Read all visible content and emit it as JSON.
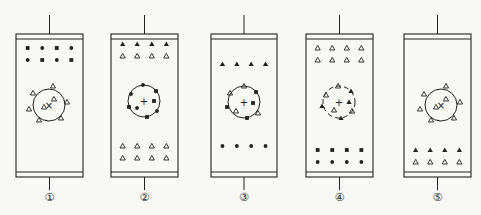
{
  "diagram": {
    "stroke_color": "#222222",
    "background": "#f8f8f6",
    "columns": [
      {
        "id": 1,
        "label": "①",
        "x": 16,
        "width": 67,
        "circle": {
          "cx": 49,
          "cy": 105,
          "r": 16,
          "style": "solid",
          "center_mark": "×"
        },
        "groups": [
          {
            "name": "top-row-1",
            "y": 48,
            "items": [
              "square",
              "dot",
              "square",
              "dot"
            ]
          },
          {
            "name": "top-row-2",
            "y": 60,
            "items": [
              "dot",
              "square",
              "dot",
              "square"
            ]
          }
        ],
        "circle_items": [
          {
            "shape": "triangle-open",
            "dx": -16,
            "dy": -12
          },
          {
            "shape": "triangle-open",
            "dx": 4,
            "dy": -19
          },
          {
            "shape": "triangle-open",
            "dx": 18,
            "dy": -3
          },
          {
            "shape": "triangle-open",
            "dx": 12,
            "dy": 13
          },
          {
            "shape": "triangle-open",
            "dx": -10,
            "dy": 15
          },
          {
            "shape": "triangle-open",
            "dx": -20,
            "dy": 4
          },
          {
            "shape": "triangle-open",
            "dx": 5,
            "dy": -6
          },
          {
            "shape": "triangle-open",
            "dx": -5,
            "dy": 2
          }
        ]
      },
      {
        "id": 2,
        "label": "②",
        "x": 111,
        "width": 67,
        "circle": {
          "cx": 144,
          "cy": 101,
          "r": 16,
          "style": "solid",
          "center_mark": "+"
        },
        "groups": [
          {
            "name": "top-row-1",
            "y": 44,
            "items": [
              "triangle-filled",
              "triangle-filled",
              "triangle-filled",
              "triangle-filled"
            ]
          },
          {
            "name": "top-row-2",
            "y": 56,
            "items": [
              "triangle-open",
              "triangle-open",
              "triangle-open",
              "triangle-open"
            ]
          },
          {
            "name": "bottom-row-1",
            "y": 146,
            "items": [
              "triangle-open",
              "triangle-open",
              "triangle-open",
              "triangle-open"
            ]
          },
          {
            "name": "bottom-row-2",
            "y": 158,
            "items": [
              "triangle-open",
              "triangle-open",
              "triangle-open",
              "triangle-open"
            ]
          }
        ],
        "circle_items": [
          {
            "shape": "dot",
            "dx": -1,
            "dy": -16
          },
          {
            "shape": "square",
            "dx": 12,
            "dy": -10
          },
          {
            "shape": "square",
            "dx": 10,
            "dy": 0
          },
          {
            "shape": "dot",
            "dx": 13,
            "dy": 10
          },
          {
            "shape": "square",
            "dx": 3,
            "dy": 16
          },
          {
            "shape": "dot",
            "dx": -7,
            "dy": 7
          },
          {
            "shape": "square",
            "dx": -15,
            "dy": 6
          },
          {
            "shape": "dot",
            "dx": -13,
            "dy": -7
          }
        ]
      },
      {
        "id": 3,
        "label": "③",
        "x": 211,
        "width": 66,
        "circle": {
          "cx": 244,
          "cy": 102,
          "r": 16,
          "style": "solid",
          "center_mark": "+"
        },
        "groups": [
          {
            "name": "top-row",
            "y": 64,
            "items": [
              "triangle-filled",
              "triangle-filled",
              "triangle-filled",
              "triangle-filled"
            ]
          },
          {
            "name": "bottom-row",
            "y": 146,
            "items": [
              "dot",
              "dot",
              "dot",
              "dot"
            ]
          }
        ],
        "circle_items": [
          {
            "shape": "triangle-open",
            "dx": 0,
            "dy": -16
          },
          {
            "shape": "square",
            "dx": 12,
            "dy": -10
          },
          {
            "shape": "square",
            "dx": 9,
            "dy": 1
          },
          {
            "shape": "triangle-open",
            "dx": 14,
            "dy": 11
          },
          {
            "shape": "square",
            "dx": 3,
            "dy": 16
          },
          {
            "shape": "triangle-open",
            "dx": -8,
            "dy": 9
          },
          {
            "shape": "square",
            "dx": -17,
            "dy": 5
          },
          {
            "shape": "triangle-open",
            "dx": -14,
            "dy": -9
          }
        ]
      },
      {
        "id": 4,
        "label": "④",
        "x": 306,
        "width": 67,
        "circle": {
          "cx": 339,
          "cy": 102,
          "r": 16,
          "style": "dashed",
          "center_mark": "+"
        },
        "groups": [
          {
            "name": "top-row-1",
            "y": 48,
            "items": [
              "triangle-open",
              "triangle-open",
              "triangle-open",
              "triangle-open"
            ]
          },
          {
            "name": "top-row-2",
            "y": 60,
            "items": [
              "triangle-open",
              "triangle-open",
              "triangle-open",
              "triangle-open"
            ]
          },
          {
            "name": "bottom-row-1",
            "y": 150,
            "items": [
              "square",
              "square",
              "square",
              "square"
            ]
          },
          {
            "name": "bottom-row-2",
            "y": 162,
            "items": [
              "dot",
              "dot",
              "dot",
              "dot"
            ]
          }
        ],
        "circle_items": [
          {
            "shape": "triangle-open",
            "dx": -1,
            "dy": -16
          },
          {
            "shape": "triangle-filled",
            "dx": 12,
            "dy": -11
          },
          {
            "shape": "triangle-filled",
            "dx": 10,
            "dy": 0
          },
          {
            "shape": "triangle-open",
            "dx": 13,
            "dy": 9
          },
          {
            "shape": "triangle-filled",
            "dx": 2,
            "dy": 16
          },
          {
            "shape": "triangle-open",
            "dx": -5,
            "dy": 8
          },
          {
            "shape": "triangle-filled",
            "dx": -17,
            "dy": 4
          },
          {
            "shape": "triangle-open",
            "dx": -13,
            "dy": -7
          }
        ]
      },
      {
        "id": 5,
        "label": "⑤",
        "x": 404,
        "width": 67,
        "circle": {
          "cx": 441,
          "cy": 105,
          "r": 16,
          "style": "solid",
          "center_mark": "×"
        },
        "groups": [
          {
            "name": "bottom-row-1",
            "y": 150,
            "items": [
              "triangle-filled",
              "triangle-filled",
              "triangle-filled",
              "triangle-filled"
            ]
          },
          {
            "name": "bottom-row-2",
            "y": 162,
            "items": [
              "triangle-open",
              "triangle-open",
              "triangle-open",
              "triangle-open"
            ]
          }
        ],
        "circle_items": [
          {
            "shape": "triangle-open",
            "dx": -17,
            "dy": -11
          },
          {
            "shape": "triangle-open",
            "dx": 5,
            "dy": -19
          },
          {
            "shape": "triangle-open",
            "dx": 19,
            "dy": -3
          },
          {
            "shape": "triangle-open",
            "dx": 13,
            "dy": 13
          },
          {
            "shape": "triangle-open",
            "dx": -10,
            "dy": 15
          },
          {
            "shape": "triangle-open",
            "dx": -21,
            "dy": 4
          },
          {
            "shape": "triangle-open",
            "dx": 5,
            "dy": -6
          },
          {
            "shape": "triangle-open",
            "dx": -5,
            "dy": 2
          }
        ]
      }
    ],
    "geometry": {
      "wire_top_y": 15,
      "box_top_y": 34,
      "band_height": 5,
      "box_bottom_y": 177,
      "wire_bottom_y": 190,
      "label_y": 201
    }
  }
}
